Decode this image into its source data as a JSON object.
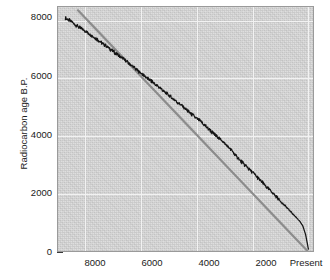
{
  "chart_data": {
    "type": "line",
    "title": "",
    "xlabel": "",
    "ylabel": "Radiocarbon age B.P.",
    "xlim": [
      9000,
      -200
    ],
    "ylim": [
      0,
      8500
    ],
    "x_axis_reversed": true,
    "grid": true,
    "legend_position": "none",
    "xticks": [
      8000,
      6000,
      4000,
      2000,
      0
    ],
    "xticklabels": [
      "8000",
      "6000",
      "4000",
      "2000",
      "Present"
    ],
    "x_minor_tick_interval": 200,
    "yticks": [
      0,
      2000,
      4000,
      6000,
      8000
    ],
    "yticklabels": [
      "0",
      "2000",
      "4000",
      "6000",
      "8000"
    ],
    "y_minor_tick_interval": 500,
    "series": [
      {
        "name": "calibration-curve",
        "style": "jagged-line",
        "color": "#141414",
        "x": [
          8700,
          8600,
          8500,
          8400,
          8300,
          8200,
          8100,
          8000,
          7900,
          7800,
          7700,
          7600,
          7500,
          7400,
          7300,
          7200,
          7100,
          7000,
          6900,
          6800,
          6700,
          6600,
          6500,
          6400,
          6300,
          6200,
          6100,
          6000,
          5900,
          5800,
          5700,
          5600,
          5500,
          5400,
          5300,
          5200,
          5100,
          5000,
          4900,
          4800,
          4700,
          4600,
          4500,
          4400,
          4300,
          4200,
          4100,
          4000,
          3900,
          3800,
          3700,
          3600,
          3500,
          3400,
          3300,
          3200,
          3100,
          3000,
          2900,
          2800,
          2700,
          2600,
          2500,
          2400,
          2300,
          2200,
          2100,
          2000,
          1900,
          1800,
          1700,
          1600,
          1500,
          1400,
          1300,
          1200,
          1100,
          1000,
          900,
          800,
          700,
          600,
          500,
          400,
          300,
          200,
          100,
          0
        ],
        "y": [
          8100,
          8020,
          7980,
          7890,
          7830,
          7760,
          7700,
          7640,
          7580,
          7510,
          7440,
          7360,
          7300,
          7230,
          7160,
          7090,
          7010,
          6940,
          6870,
          6800,
          6720,
          6650,
          6580,
          6500,
          6420,
          6340,
          6260,
          6180,
          6110,
          6030,
          5960,
          5890,
          5800,
          5730,
          5660,
          5580,
          5500,
          5420,
          5340,
          5260,
          5180,
          5100,
          5020,
          4940,
          4860,
          4780,
          4700,
          4620,
          4540,
          4450,
          4370,
          4280,
          4190,
          4090,
          4010,
          3930,
          3850,
          3760,
          3660,
          3560,
          3450,
          3330,
          3220,
          3120,
          3030,
          2940,
          2840,
          2750,
          2650,
          2550,
          2450,
          2350,
          2250,
          2160,
          2060,
          1960,
          1860,
          1760,
          1660,
          1560,
          1460,
          1360,
          1260,
          1160,
          1050,
          900,
          600,
          100
        ],
        "description": "Black wiggly INTCAL-style radiocarbon calibration curve lying below the 1:1 line"
      },
      {
        "name": "one-to-one-reference-line",
        "style": "straight-line",
        "color": "#8c8c8c",
        "x": [
          8250,
          0
        ],
        "y": [
          8350,
          0
        ],
        "description": "Gray straight reference line where radiocarbon age equals calendar age"
      }
    ]
  },
  "axes": {
    "y_title": "Radiocarbon age B.P.",
    "x_ticklabels": [
      "8000",
      "6000",
      "4000",
      "2000",
      "Present"
    ],
    "y_ticklabels": [
      "8000",
      "6000",
      "4000",
      "2000",
      "0"
    ]
  },
  "colors": {
    "plot_background": "#d6d6d6",
    "gridline": "#f2f2f2",
    "curve": "#141414",
    "reference_line": "#8c8c8c",
    "axis": "#3a3a3a",
    "text": "#1a1a1a"
  }
}
